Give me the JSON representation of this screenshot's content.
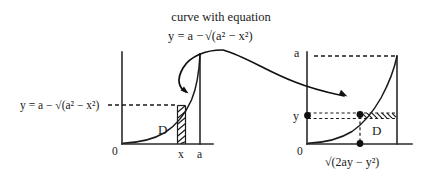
{
  "figure": {
    "caption_line1": "curve with equation",
    "caption_line2_prefix": "y = a − ",
    "caption_line2_radical": "√(a² − x²)",
    "background_color": "#ffffff",
    "ink_color": "#1a1a1a"
  },
  "left_graph": {
    "name": "xy-plane-region-D",
    "y_axis_label": "y = a − √(a² − x²)",
    "origin_label": "0",
    "x_tick_label": "x",
    "x_end_label": "a",
    "region_label": "D",
    "strip_orientation": "vertical",
    "hatch_count": 7
  },
  "right_graph": {
    "name": "yx-plane-region-D",
    "y_top_label": "a",
    "y_tick_label": "y",
    "origin_label": "0",
    "x_expression_label": "√(2ay − y²)",
    "region_label": "D",
    "strip_orientation": "horizontal",
    "hatch_count": 7,
    "dot_count": 3
  },
  "annotations": {
    "arrow_left_target": "curve-in-left-graph",
    "arrow_right_target": "curve-in-right-graph",
    "arrow_count": 2
  }
}
